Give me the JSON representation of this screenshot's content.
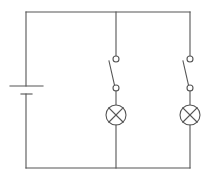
{
  "diagram": {
    "type": "electrical-circuit",
    "colors": {
      "wire": "#555555",
      "background": "#ffffff"
    },
    "components": [
      {
        "id": "battery",
        "kind": "cell",
        "label": ""
      },
      {
        "id": "switch-1",
        "kind": "switch",
        "state": "open",
        "label": ""
      },
      {
        "id": "lamp-1",
        "kind": "lamp",
        "label": ""
      },
      {
        "id": "switch-2",
        "kind": "switch",
        "state": "open",
        "label": ""
      },
      {
        "id": "lamp-2",
        "kind": "lamp",
        "label": ""
      }
    ],
    "branches": [
      {
        "name": "branch-1",
        "series": [
          "switch-1",
          "lamp-1"
        ]
      },
      {
        "name": "branch-2",
        "series": [
          "switch-2",
          "lamp-2"
        ]
      }
    ]
  }
}
